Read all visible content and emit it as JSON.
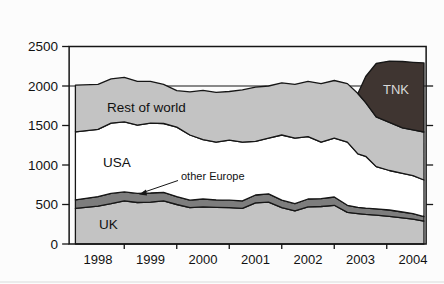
{
  "page_title": "kb/day",
  "chart_data": {
    "type": "area",
    "stacked": true,
    "title": "kb/day",
    "unit": "kb/day",
    "grid": "off",
    "legend": "inline-labels",
    "xlim": [
      1997.45,
      2004.25
    ],
    "ylim": [
      0,
      2500
    ],
    "yticks": [
      0,
      500,
      1000,
      1500,
      2000,
      2500
    ],
    "xtick_labels": [
      "1998",
      "1999",
      "2000",
      "2001",
      "2002",
      "2003",
      "2004"
    ],
    "xtick_values": [
      1998,
      1999,
      2000,
      2001,
      2002,
      2003,
      2004
    ],
    "x_minor_ticks": [
      1998.5,
      1999.5,
      2000.5,
      2001.5,
      2002.5,
      2003.5
    ],
    "reference_line": 2000,
    "x": [
      1997.57,
      1998.0,
      1998.25,
      1998.5,
      1998.75,
      1999.0,
      1999.25,
      1999.5,
      1999.75,
      2000.0,
      2000.25,
      2000.5,
      2000.75,
      2001.0,
      2001.25,
      2001.5,
      2001.75,
      2002.0,
      2002.25,
      2002.5,
      2002.75,
      2002.95,
      2003.1,
      2003.3,
      2003.55,
      2003.8,
      2004.0,
      2004.21
    ],
    "series": [
      {
        "name": "UK",
        "color": "#c3c3c3",
        "values": [
          450,
          480,
          510,
          545,
          525,
          530,
          545,
          500,
          460,
          470,
          465,
          460,
          450,
          520,
          530,
          460,
          420,
          470,
          475,
          490,
          400,
          385,
          375,
          365,
          350,
          330,
          315,
          290
        ]
      },
      {
        "name": "other Europe",
        "color": "#7d7d7d",
        "values": [
          110,
          120,
          130,
          115,
          115,
          115,
          110,
          100,
          95,
          100,
          95,
          95,
          95,
          100,
          105,
          95,
          90,
          100,
          100,
          105,
          90,
          80,
          80,
          80,
          80,
          75,
          70,
          55
        ]
      },
      {
        "name": "USA",
        "color": "#ffffff",
        "values": [
          860,
          850,
          890,
          885,
          865,
          885,
          870,
          880,
          825,
          750,
          730,
          760,
          745,
          680,
          705,
          825,
          830,
          790,
          715,
          745,
          800,
          675,
          655,
          535,
          500,
          490,
          480,
          465
        ]
      },
      {
        "name": "Rest of world",
        "color": "#c3c3c3",
        "values": [
          590,
          570,
          560,
          565,
          555,
          530,
          495,
          460,
          545,
          625,
          630,
          615,
          660,
          685,
          660,
          660,
          680,
          700,
          740,
          730,
          740,
          765,
          680,
          630,
          610,
          575,
          580,
          608
        ]
      },
      {
        "name": "TNK",
        "color": "#3f3531",
        "values": [
          0,
          0,
          0,
          0,
          0,
          0,
          0,
          0,
          0,
          0,
          0,
          0,
          0,
          0,
          0,
          0,
          0,
          0,
          0,
          0,
          0,
          0,
          330,
          675,
          775,
          840,
          855,
          874
        ]
      }
    ],
    "annotations": [
      {
        "text": "other Europe",
        "target_series": "other Europe"
      }
    ],
    "colors": {
      "background": "#fcfcfc",
      "outline": "#161616",
      "axis": "#161616",
      "tick_label": "#111111",
      "area_light_gray": "#c3c3c3",
      "area_band_gray": "#7d7d7d",
      "area_white": "#ffffff",
      "area_tnk_dark": "#3f3531",
      "tnk_label_text": "#d9d9d9"
    }
  }
}
